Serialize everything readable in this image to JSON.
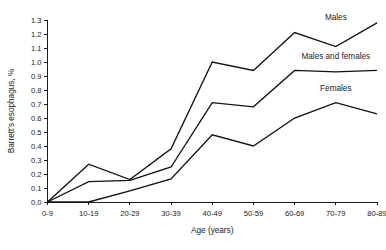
{
  "chart_data": {
    "type": "line",
    "title": "",
    "xlabel": "Age (years)",
    "ylabel": "Barrett's esophagus, %",
    "categories": [
      "0-9",
      "10-19",
      "20-29",
      "30-39",
      "40-49",
      "50-59",
      "60-69",
      "70-79",
      "80-89"
    ],
    "ylim": [
      0.0,
      1.3
    ],
    "yticks": [
      "0.0",
      "0.1",
      "0.2",
      "0.3",
      "0.4",
      "0.5",
      "0.6",
      "0.7",
      "0.8",
      "0.9",
      "1.0",
      "1.1",
      "1.2",
      "1.3"
    ],
    "grid": false,
    "legend_position": "inline-right",
    "series": [
      {
        "name": "Males",
        "values": [
          0.0,
          0.27,
          0.16,
          0.38,
          1.0,
          0.94,
          1.21,
          1.11,
          1.28
        ],
        "label_x_category": "70-79",
        "label_value": 1.3
      },
      {
        "name": "Males and females",
        "values": [
          0.0,
          0.145,
          0.155,
          0.25,
          0.71,
          0.68,
          0.94,
          0.93,
          0.94
        ],
        "label_x_category": "70-79",
        "label_value": 1.02
      },
      {
        "name": "Females",
        "values": [
          0.0,
          0.0,
          0.08,
          0.165,
          0.48,
          0.4,
          0.6,
          0.71,
          0.63
        ],
        "label_x_category": "70-79",
        "label_value": 0.79
      }
    ]
  }
}
